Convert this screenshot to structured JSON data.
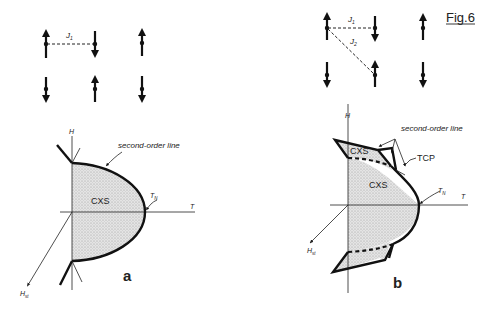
{
  "figure": {
    "title": "Fig.6",
    "panel_a": {
      "label": "a",
      "lattice": {
        "rows": [
          [
            "up",
            "down",
            "up"
          ],
          [
            "down",
            "up",
            "down"
          ]
        ],
        "coupling_labels": [
          "J1"
        ]
      },
      "phase_diagram": {
        "axis_h": "H",
        "axis_t": "T",
        "axis_hst": "Hst",
        "phase_label": "CXS",
        "transition_label": "TN",
        "line_label": "second-order line"
      }
    },
    "panel_b": {
      "label": "b",
      "lattice": {
        "rows": [
          [
            "up",
            "down",
            "up"
          ],
          [
            "down",
            "up",
            "down"
          ]
        ],
        "coupling_labels": [
          "J1",
          "J2"
        ]
      },
      "phase_diagram": {
        "axis_h": "H",
        "axis_t": "T",
        "axis_hst": "Hst",
        "phase_label_main": "CXS",
        "phase_label_wing": "CXS",
        "transition_label": "TN",
        "line_label": "second-order line",
        "tricritical_label": "TCP"
      }
    }
  },
  "colors": {
    "ink": "#111111",
    "shade": "#d8d8d8",
    "background": "#ffffff"
  }
}
